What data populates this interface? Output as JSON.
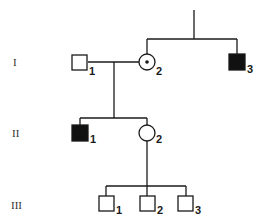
{
  "colors": {
    "ink": "#1a1a1a",
    "affected_fill": "#111111",
    "unaffected_fill": "#ffffff"
  },
  "generations": [
    {
      "label": "I"
    },
    {
      "label": "II"
    },
    {
      "label": "III"
    }
  ],
  "individuals": [
    {
      "id": "I-1",
      "number": "1",
      "generation": "I",
      "sex": "male",
      "status": "unaffected"
    },
    {
      "id": "I-2",
      "number": "2",
      "generation": "I",
      "sex": "female",
      "status": "carrier"
    },
    {
      "id": "I-3",
      "number": "3",
      "generation": "I",
      "sex": "male",
      "status": "affected"
    },
    {
      "id": "II-1",
      "number": "1",
      "generation": "II",
      "sex": "male",
      "status": "affected"
    },
    {
      "id": "II-2",
      "number": "2",
      "generation": "II",
      "sex": "female",
      "status": "unaffected"
    },
    {
      "id": "III-1",
      "number": "1",
      "generation": "III",
      "sex": "male",
      "status": "unaffected"
    },
    {
      "id": "III-2",
      "number": "2",
      "generation": "III",
      "sex": "male",
      "status": "unaffected"
    },
    {
      "id": "III-3",
      "number": "3",
      "generation": "III",
      "sex": "male",
      "status": "unaffected"
    }
  ],
  "relationships": [
    {
      "type": "siblings",
      "members": [
        "I-2",
        "I-3"
      ],
      "parents": "unknown"
    },
    {
      "type": "mating",
      "members": [
        "I-1",
        "I-2"
      ],
      "children": [
        "II-1",
        "II-2"
      ]
    },
    {
      "type": "parent-child",
      "parent": "II-2",
      "children": [
        "III-1",
        "III-2",
        "III-3"
      ]
    }
  ]
}
